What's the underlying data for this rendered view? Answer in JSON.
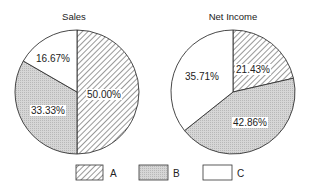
{
  "chart_data": [
    {
      "type": "pie",
      "title": "Sales",
      "categories": [
        "A",
        "B",
        "C"
      ],
      "values": [
        50.0,
        33.33,
        16.67
      ],
      "labels": [
        "50.00%",
        "33.33%",
        "16.67%"
      ]
    },
    {
      "type": "pie",
      "title": "Net Income",
      "categories": [
        "A",
        "B",
        "C"
      ],
      "values": [
        21.43,
        42.86,
        35.71
      ],
      "labels": [
        "21.43%",
        "42.86%",
        "35.71%"
      ]
    }
  ],
  "legend": {
    "position": "bottom",
    "items": [
      {
        "label": "A",
        "pattern": "diagonal-hatch"
      },
      {
        "label": "B",
        "pattern": "gray-dots"
      },
      {
        "label": "C",
        "pattern": "white"
      }
    ]
  },
  "colors": {
    "stroke": "#333333",
    "b_fill": "#d4d4d4",
    "c_fill": "#ffffff",
    "background": "#ffffff"
  }
}
